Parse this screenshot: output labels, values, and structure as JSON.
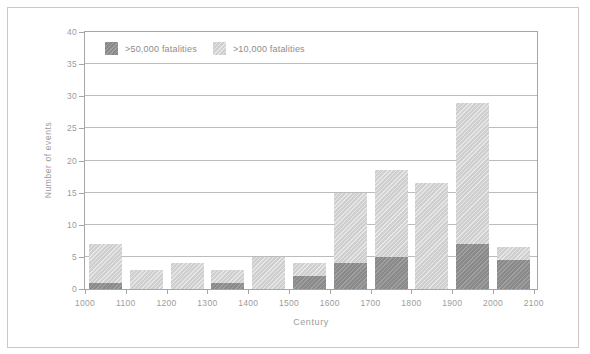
{
  "colors": {
    "bar_dark": "#8e8e8e",
    "bar_light": "#d4d4d4",
    "gridline": "#bcbcbc",
    "axis_border": "#a6a6a6",
    "tick_text": "#9c9c9c",
    "legend_text": "#8c8c8c",
    "frame_border": "#c9c9c9",
    "background": "#ffffff"
  },
  "chart_data": {
    "type": "bar",
    "subtype": "stacked-overlay-columns",
    "title": "",
    "xlabel": "Century",
    "ylabel": "Number of events",
    "ylim": [
      0,
      40
    ],
    "y_ticks": [
      0,
      5,
      10,
      15,
      20,
      25,
      30,
      35,
      40
    ],
    "x_ticks": [
      1000,
      1100,
      1200,
      1300,
      1400,
      1500,
      1600,
      1700,
      1800,
      1900,
      2000,
      2100
    ],
    "categories": [
      1000,
      1100,
      1200,
      1300,
      1400,
      1500,
      1600,
      1700,
      1800,
      1900,
      2000
    ],
    "categories_note": "each bar spans the century interval between adjacent x ticks",
    "series": [
      {
        "name": ">50,000 fatalities",
        "role": "dark-bottom-segment",
        "values": [
          1,
          0,
          0,
          1,
          0,
          2,
          4,
          5,
          0,
          7,
          4.5
        ]
      },
      {
        "name": ">10,000 fatalities",
        "role": "light-total-bar",
        "values": [
          7,
          3,
          4,
          3,
          5,
          4,
          15,
          18.5,
          16.5,
          29,
          6.5
        ]
      }
    ],
    "legend_position": "top-left-inside",
    "grid": "horizontal-only"
  }
}
